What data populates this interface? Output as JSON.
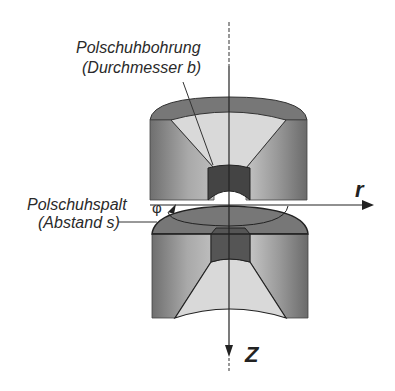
{
  "diagram": {
    "type": "pole-piece cross-section",
    "labels": {
      "bore_line1": "Polschuhbohrung",
      "bore_line2": "(Durchmesser b)",
      "gap_line1": "Polschuhspalt",
      "gap_line2": "(Abstand s)",
      "phi": "φ",
      "r_axis": "r",
      "z_axis": "Z"
    },
    "colors": {
      "outer_body": "#8a8a8a",
      "top_cap": "#777777",
      "cone_inner": "#d8d8d8",
      "bore": "#444444",
      "line": "#222222"
    }
  }
}
